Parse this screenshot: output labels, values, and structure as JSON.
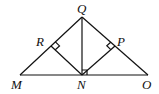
{
  "diagram": {
    "type": "geometry",
    "points": {
      "Q": {
        "label": "Q",
        "x": 82,
        "y": 17
      },
      "M": {
        "label": "M",
        "x": 20,
        "y": 75
      },
      "O": {
        "label": "O",
        "x": 148,
        "y": 75
      },
      "N": {
        "label": "N",
        "x": 82,
        "y": 75
      },
      "R": {
        "label": "R",
        "x": 51,
        "y": 46
      },
      "P": {
        "label": "P",
        "x": 115,
        "y": 46
      }
    },
    "segments": [
      "QM",
      "QO",
      "MO",
      "QN",
      "NR",
      "NP"
    ],
    "right_angles": [
      "QRN",
      "QPN",
      "QNO"
    ],
    "line_color": "#111111"
  }
}
